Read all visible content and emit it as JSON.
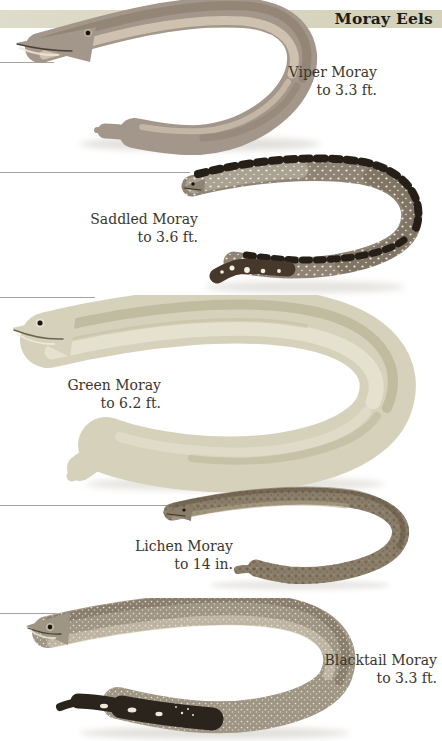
{
  "page": {
    "title": "Moray Eels",
    "band_color": "#d7d5bf",
    "background": "#ffffff",
    "label_text_color": "#3a362e"
  },
  "species": [
    {
      "name": "Viper Moray",
      "size": "to 3.3 ft.",
      "body_color": "#a3968a"
    },
    {
      "name": "Saddled Moray",
      "size": "to 3.6 ft.",
      "body_color": "#8e8375"
    },
    {
      "name": "Green Moray",
      "size": "to 6.2 ft.",
      "body_color": "#d6d1ba"
    },
    {
      "name": "Lichen Moray",
      "size": "to 14 in.",
      "body_color": "#8a7d69"
    },
    {
      "name": "Blacktail Moray",
      "size": "to 3.3 ft.",
      "body_color": "#9f9585"
    }
  ]
}
